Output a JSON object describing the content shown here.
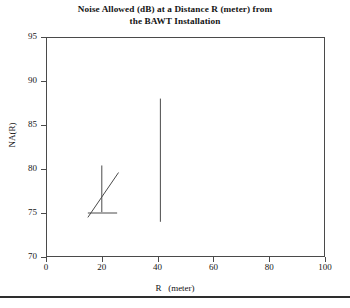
{
  "chart_data": {
    "type": "line",
    "title": "Noise Allowed (dB) at a Distance R (meter) from the BAWT Installation",
    "title_line1": "Noise Allowed (dB) at a Distance R (meter) from",
    "title_line2": "the BAWT Installation",
    "xlabel": "R   (meter)",
    "ylabel": "NA(R)",
    "xlim": [
      0,
      100
    ],
    "ylim": [
      70,
      95
    ],
    "xticks": [
      0,
      20,
      40,
      60,
      80,
      100
    ],
    "yticks": [
      70,
      75,
      80,
      85,
      90,
      95
    ],
    "xtick_labels": [
      "0",
      "20",
      "40",
      "60",
      "80",
      "100"
    ],
    "ytick_labels": [
      "70",
      "75",
      "80",
      "85",
      "90",
      "95"
    ],
    "grid": false,
    "legend": "none",
    "line_color": "#4a4a4a",
    "frame_color": "#4a4a4a",
    "background": "#ffffff",
    "series": [
      {
        "name": "tall-vertical-marker",
        "x": [
          41,
          41
        ],
        "values": [
          74,
          88
        ]
      },
      {
        "name": "short-vertical-marker",
        "x": [
          20,
          20
        ],
        "values": [
          75.1,
          80.4
        ]
      },
      {
        "name": "horizontal-marker",
        "x": [
          15,
          25.5
        ],
        "values": [
          75,
          75
        ]
      },
      {
        "name": "diagonal-trend",
        "x": [
          15,
          26
        ],
        "values": [
          74.5,
          79.6
        ]
      }
    ]
  },
  "figure": {
    "xtick_label_0": "0",
    "xtick_label_1": "20",
    "xtick_label_2": "40",
    "xtick_label_3": "60",
    "xtick_label_4": "80",
    "xtick_label_5": "100",
    "ytick_label_0": "70",
    "ytick_label_1": "75",
    "ytick_label_2": "80",
    "ytick_label_3": "85",
    "ytick_label_4": "90",
    "ytick_label_5": "95"
  }
}
